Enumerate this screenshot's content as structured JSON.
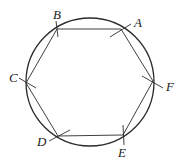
{
  "diagram": {
    "circle": {
      "cx": 90,
      "cy": 82,
      "r": 64
    },
    "vertices": [
      {
        "label": "A",
        "x": 121,
        "y": 29,
        "lx": 134,
        "ly": 27
      },
      {
        "label": "F",
        "x": 153,
        "y": 81,
        "lx": 166,
        "ly": 91
      },
      {
        "label": "E",
        "x": 123,
        "y": 135,
        "lx": 118,
        "ly": 157
      },
      {
        "label": "D",
        "x": 58,
        "y": 136,
        "lx": 37,
        "ly": 146
      },
      {
        "label": "C",
        "x": 26,
        "y": 83,
        "lx": 9,
        "ly": 82
      },
      {
        "label": "B",
        "x": 57,
        "y": 29,
        "lx": 53,
        "ly": 19
      }
    ],
    "stroke_color": "#2a2a2a"
  }
}
